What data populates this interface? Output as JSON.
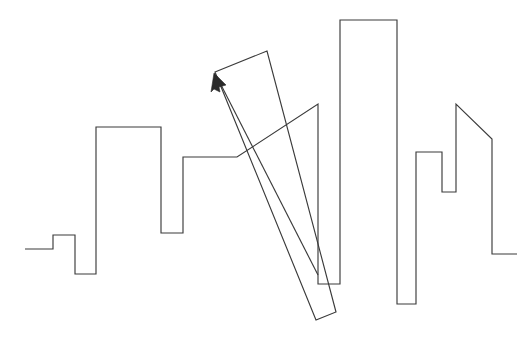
{
  "figure": {
    "title": "Abstract skyline line drawing with overlaid quadrilateral and arrow",
    "kind": "line-drawing",
    "canvas": {
      "width": 531,
      "height": 337
    },
    "background_color": "#ffffff",
    "stroke_color": "#3b3b3b",
    "arrow_fill_color": "#2a2a2a",
    "stroke_width": 1.15,
    "shapes": [
      {
        "name": "skyline-polyline",
        "semantic": "city skyline profile, open polyline drawn left to right",
        "closed": false,
        "points": "25,249 53,249 53,235 75,235 75,274 96,274 96,127 161,127 161,233 183,233 183,157 237,157 318,104 318,284 340,284 340,20 397,20 397,304 416,304 416,152 442,152 442,192 456,192 456,104 492,139 492,254 517,254"
      },
      {
        "name": "tilted-quadrilateral",
        "semantic": "long narrow rotated rectangle crossing the skyline",
        "closed": true,
        "points": "215,72 267,51 336,312 316,320"
      },
      {
        "name": "arrow-shaft",
        "semantic": "straight arrow pointing up-left toward the quadrilateral corner",
        "closed": false,
        "points": "318,275 217,77"
      },
      {
        "name": "arrow-head",
        "semantic": "solid triangular arrowhead at the upper-left tip",
        "closed": true,
        "points": "214,73 226,85 219,87 220,92 214,89 211,92"
      }
    ]
  }
}
